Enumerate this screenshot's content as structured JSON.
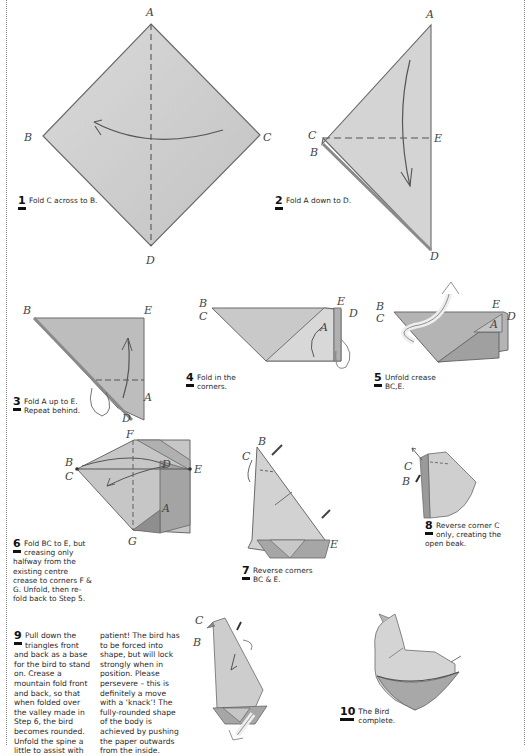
{
  "page": {
    "colors": {
      "paper_light": "#d9d9d9",
      "paper_mid": "#c4c4c4",
      "paper_dark": "#9e9e9e",
      "line": "#555555",
      "border": "#888888"
    }
  },
  "steps": [
    {
      "number": "1",
      "text": "Fold C across to B.",
      "labels": [
        "A",
        "B",
        "C",
        "D"
      ]
    },
    {
      "number": "2",
      "text": "Fold A down to D.",
      "labels": [
        "A",
        "C",
        "B",
        "E",
        "D"
      ]
    },
    {
      "number": "3",
      "text_lines": [
        "Fold A up to E.",
        "Repeat behind."
      ],
      "labels": [
        "B",
        "E",
        "D",
        "A"
      ]
    },
    {
      "number": "4",
      "text_lines": [
        "Fold in the",
        "corners."
      ],
      "labels": [
        "B",
        "C",
        "E",
        "D",
        "A"
      ]
    },
    {
      "number": "5",
      "text_lines": [
        "Unfold crease",
        "BC,E."
      ],
      "labels": [
        "B",
        "C",
        "E",
        "D",
        "A"
      ]
    },
    {
      "number": "6",
      "text_lines": [
        "Fold BC to E, but",
        "creasing only",
        "halfway from the",
        "existing centre",
        "crease to corners F &",
        "G. Unfold, then re-",
        "fold back to Step 5."
      ],
      "labels": [
        "F",
        "D",
        "B",
        "C",
        "E",
        "A",
        "G"
      ]
    },
    {
      "number": "7",
      "text_lines": [
        "Reverse corners",
        "BC & E."
      ],
      "labels": [
        "B",
        "C",
        "E"
      ]
    },
    {
      "number": "8",
      "text_lines": [
        "Reverse corner C",
        "only, creating the",
        "open beak."
      ],
      "labels": [
        "C",
        "B"
      ]
    },
    {
      "number": "9",
      "col1_lines": [
        "Pull down the",
        "triangles front",
        "and back as a base",
        "for the bird to stand",
        "on. Crease a",
        "mountain fold front",
        "and back, so that",
        "when folded over",
        "the valley made in",
        "Step 6, the bird",
        "becomes rounded.",
        "Unfold the spine a",
        "little to assist with"
      ],
      "col2_lines": [
        "patient! The bird has",
        "to be forced into",
        "shape, but will lock",
        "strongly when in",
        "position. Please",
        "persevere – this is",
        "definitely a move",
        "with a ‘knack’! The",
        "fully-rounded shape",
        "of the body is",
        "achieved by pushing",
        "the paper outwards",
        "from the inside."
      ],
      "labels": [
        "C",
        "B"
      ]
    },
    {
      "number": "10",
      "text_lines": [
        "The Bird",
        "complete."
      ]
    }
  ]
}
